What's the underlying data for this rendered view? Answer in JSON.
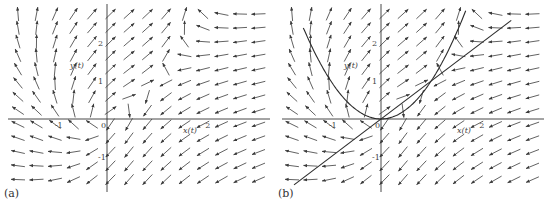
{
  "figure": {
    "panels": [
      {
        "id": "a",
        "label": "(a)",
        "axis_labels": {
          "x": "x(t)",
          "y": "y(t)"
        },
        "x_ticks": [
          {
            "value": -1,
            "text": "-1"
          },
          {
            "value": 0,
            "text": "0"
          },
          {
            "value": 2,
            "text": "2"
          }
        ],
        "y_ticks": [
          {
            "value": 2,
            "text": "2"
          },
          {
            "value": 1,
            "text": "1"
          },
          {
            "value": -1,
            "text": "-1"
          }
        ],
        "show_nullclines": false
      },
      {
        "id": "b",
        "label": "(b)",
        "axis_labels": {
          "x": "x(t)",
          "y": "y(t)"
        },
        "x_ticks": [
          {
            "value": -1,
            "text": "-1"
          },
          {
            "value": 0,
            "text": "0"
          },
          {
            "value": 2,
            "text": "2"
          }
        ],
        "y_ticks": [
          {
            "value": 2,
            "text": "2"
          },
          {
            "value": 1,
            "text": "1"
          },
          {
            "value": -1,
            "text": "-1"
          }
        ],
        "show_nullclines": true,
        "nullclines": [
          {
            "name": "parabola",
            "equation": "y = x^2"
          },
          {
            "name": "line",
            "equation": "y = x"
          }
        ]
      }
    ],
    "field": {
      "description": "direction field of planar system",
      "dx": "y - x^2",
      "dy": "y - x",
      "x_range": [
        -2.4,
        2.75
      ],
      "y_range": [
        -1.6,
        3.2
      ],
      "grid_cols": 14,
      "grid_rows": 13
    },
    "colors": {
      "arrow": "#3a3a3a",
      "axis": "#333333",
      "curve": "#2a2a2a",
      "accent_green": "#6fcf6f",
      "accent_red": "#d77b7b"
    }
  }
}
